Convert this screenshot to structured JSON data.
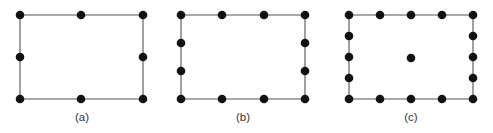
{
  "figure": {
    "type": "finite-element-node-diagram",
    "width": 493,
    "height": 133,
    "background_color": "#ffffff",
    "edge_color": "#555555",
    "node_color": "#111111",
    "caption_color": "#333333",
    "node_radius": 4.3,
    "panels": [
      {
        "id": "a",
        "caption": "(a)",
        "caption_x": 82,
        "caption_y": 121,
        "rect": {
          "x0": 20,
          "y0": 15,
          "x1": 143,
          "y1": 99
        },
        "node_count": 8,
        "nodes": [
          {
            "x": 20,
            "y": 15
          },
          {
            "x": 81,
            "y": 15
          },
          {
            "x": 143,
            "y": 15
          },
          {
            "x": 20,
            "y": 57
          },
          {
            "x": 143,
            "y": 57
          },
          {
            "x": 20,
            "y": 99
          },
          {
            "x": 81,
            "y": 99
          },
          {
            "x": 143,
            "y": 99
          }
        ]
      },
      {
        "id": "b",
        "caption": "(b)",
        "caption_x": 243,
        "caption_y": 121,
        "rect": {
          "x0": 181,
          "y0": 15,
          "x1": 305,
          "y1": 99
        },
        "node_count": 12,
        "nodes": [
          {
            "x": 181,
            "y": 15
          },
          {
            "x": 222,
            "y": 15
          },
          {
            "x": 264,
            "y": 15
          },
          {
            "x": 305,
            "y": 15
          },
          {
            "x": 181,
            "y": 43
          },
          {
            "x": 305,
            "y": 43
          },
          {
            "x": 181,
            "y": 71
          },
          {
            "x": 305,
            "y": 71
          },
          {
            "x": 181,
            "y": 99
          },
          {
            "x": 222,
            "y": 99
          },
          {
            "x": 264,
            "y": 99
          },
          {
            "x": 305,
            "y": 99
          }
        ]
      },
      {
        "id": "c",
        "caption": "(c)",
        "caption_x": 411,
        "caption_y": 121,
        "rect": {
          "x0": 349,
          "y0": 15,
          "x1": 473,
          "y1": 99
        },
        "node_count": 17,
        "nodes": [
          {
            "x": 349,
            "y": 15
          },
          {
            "x": 380,
            "y": 15
          },
          {
            "x": 411,
            "y": 15
          },
          {
            "x": 442,
            "y": 15
          },
          {
            "x": 473,
            "y": 15
          },
          {
            "x": 349,
            "y": 36
          },
          {
            "x": 473,
            "y": 36
          },
          {
            "x": 349,
            "y": 57
          },
          {
            "x": 411,
            "y": 58
          },
          {
            "x": 473,
            "y": 57
          },
          {
            "x": 349,
            "y": 78
          },
          {
            "x": 473,
            "y": 78
          },
          {
            "x": 349,
            "y": 99
          },
          {
            "x": 380,
            "y": 99
          },
          {
            "x": 411,
            "y": 99
          },
          {
            "x": 442,
            "y": 99
          },
          {
            "x": 473,
            "y": 99
          }
        ]
      }
    ]
  }
}
